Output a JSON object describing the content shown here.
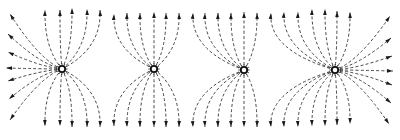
{
  "diagram": {
    "type": "electric-field-lines",
    "colors": {
      "background": "#ffffff",
      "line": "#333333",
      "arrow": "#1a1a1a",
      "charge_stroke": "#111111"
    },
    "charges": [
      {
        "id": "charge-1",
        "x": 62,
        "y": 69,
        "r": 3.2
      },
      {
        "id": "charge-2",
        "x": 154,
        "y": 69,
        "r": 3.2
      },
      {
        "id": "charge-3",
        "x": 244,
        "y": 70,
        "r": 3.2
      },
      {
        "id": "charge-4",
        "x": 335,
        "y": 70,
        "r": 3.2
      }
    ],
    "field_lines": {
      "left_edge_ends": [
        {
          "x": 10,
          "y": 14
        },
        {
          "x": 8,
          "y": 34
        },
        {
          "x": 8,
          "y": 52
        },
        {
          "x": 6,
          "y": 68
        },
        {
          "x": 8,
          "y": 81
        },
        {
          "x": 9,
          "y": 99
        },
        {
          "x": 10,
          "y": 120
        }
      ],
      "right_edge_ends": [
        {
          "x": 390,
          "y": 16
        },
        {
          "x": 391,
          "y": 38
        },
        {
          "x": 392,
          "y": 56
        },
        {
          "x": 393,
          "y": 71
        },
        {
          "x": 392,
          "y": 85
        },
        {
          "x": 391,
          "y": 103
        },
        {
          "x": 389,
          "y": 124
        }
      ],
      "top_ends": [
        {
          "x": 45,
          "y": 10,
          "c": 0
        },
        {
          "x": 60,
          "y": 10,
          "c": 0
        },
        {
          "x": 72,
          "y": 8,
          "c": 0
        },
        {
          "x": 87,
          "y": 9,
          "c": 0
        },
        {
          "x": 100,
          "y": 10,
          "c": 0
        },
        {
          "x": 114,
          "y": 14,
          "c": 1
        },
        {
          "x": 127,
          "y": 13,
          "c": 1
        },
        {
          "x": 140,
          "y": 13,
          "c": 1
        },
        {
          "x": 154,
          "y": 12,
          "c": 1
        },
        {
          "x": 166,
          "y": 13,
          "c": 1
        },
        {
          "x": 179,
          "y": 13,
          "c": 1
        },
        {
          "x": 193,
          "y": 13,
          "c": 2
        },
        {
          "x": 205,
          "y": 13,
          "c": 2
        },
        {
          "x": 218,
          "y": 13,
          "c": 2
        },
        {
          "x": 244,
          "y": 12,
          "c": 2
        },
        {
          "x": 257,
          "y": 13,
          "c": 2
        },
        {
          "x": 231,
          "y": 13,
          "c": 2
        },
        {
          "x": 271,
          "y": 13,
          "c": 3
        },
        {
          "x": 284,
          "y": 12,
          "c": 3
        },
        {
          "x": 298,
          "y": 12,
          "c": 3
        },
        {
          "x": 312,
          "y": 9,
          "c": 3
        },
        {
          "x": 325,
          "y": 9,
          "c": 3
        },
        {
          "x": 337,
          "y": 11,
          "c": 3
        },
        {
          "x": 350,
          "y": 12,
          "c": 3
        }
      ],
      "bottom_ends": [
        {
          "x": 45,
          "y": 126,
          "c": 0
        },
        {
          "x": 60,
          "y": 126,
          "c": 0
        },
        {
          "x": 72,
          "y": 127,
          "c": 0
        },
        {
          "x": 87,
          "y": 127,
          "c": 0
        },
        {
          "x": 100,
          "y": 127,
          "c": 0
        },
        {
          "x": 114,
          "y": 126,
          "c": 1
        },
        {
          "x": 127,
          "y": 127,
          "c": 1
        },
        {
          "x": 140,
          "y": 127,
          "c": 1
        },
        {
          "x": 154,
          "y": 127,
          "c": 1
        },
        {
          "x": 166,
          "y": 127,
          "c": 1
        },
        {
          "x": 179,
          "y": 127,
          "c": 1
        },
        {
          "x": 193,
          "y": 127,
          "c": 2
        },
        {
          "x": 205,
          "y": 127,
          "c": 2
        },
        {
          "x": 218,
          "y": 127,
          "c": 2
        },
        {
          "x": 231,
          "y": 127,
          "c": 2
        },
        {
          "x": 244,
          "y": 127,
          "c": 2
        },
        {
          "x": 257,
          "y": 127,
          "c": 2
        },
        {
          "x": 271,
          "y": 127,
          "c": 3
        },
        {
          "x": 284,
          "y": 127,
          "c": 3
        },
        {
          "x": 298,
          "y": 127,
          "c": 3
        },
        {
          "x": 312,
          "y": 126,
          "c": 3
        },
        {
          "x": 325,
          "y": 126,
          "c": 3
        },
        {
          "x": 337,
          "y": 125,
          "c": 3
        },
        {
          "x": 350,
          "y": 124,
          "c": 3
        }
      ]
    }
  }
}
